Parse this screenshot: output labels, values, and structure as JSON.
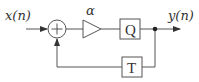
{
  "diagram": {
    "input_label": "x(n)",
    "output_label": "y(n)",
    "gain_label": "α",
    "quantizer_label": "Q",
    "delay_label": "T",
    "adder_symbol": "+",
    "stroke_color": "#555555"
  }
}
